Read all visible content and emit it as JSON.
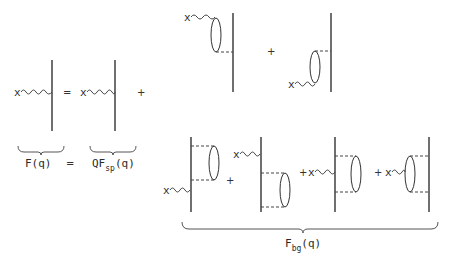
{
  "diagram": {
    "equation_lhs": {
      "label": "F(q)",
      "equals": "="
    },
    "term_sp": {
      "prefix": "QF",
      "subscript": "sp",
      "suffix": "(q)"
    },
    "term_bg": {
      "prefix": "F",
      "subscript": "bg",
      "suffix": "(q)"
    },
    "vertex_marker": "x",
    "operators": {
      "equals": "=",
      "plus": "+"
    }
  }
}
